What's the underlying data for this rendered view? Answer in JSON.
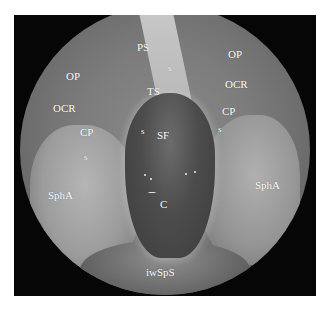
{
  "image": {
    "description": "Endoscopic view of the sphenoid sinus with anatomical labels",
    "colors": {
      "frame": "#060606",
      "label": "#ffffff",
      "background": "#ffffff"
    }
  },
  "labels": {
    "ps": "PS",
    "ts": "TS",
    "op_left": "OP",
    "ocr_left": "OCR",
    "cp_left": "CP",
    "s_left_lower": "s",
    "s_left_sf": "s",
    "s_septum": "s",
    "sf": "SF",
    "op_right": "OP",
    "ocr_right": "OCR",
    "cp_right": "CP",
    "s_right": "s",
    "spha_left": "SphA",
    "spha_right": "SphA",
    "c": "C",
    "iwsps": "iwSpS"
  }
}
